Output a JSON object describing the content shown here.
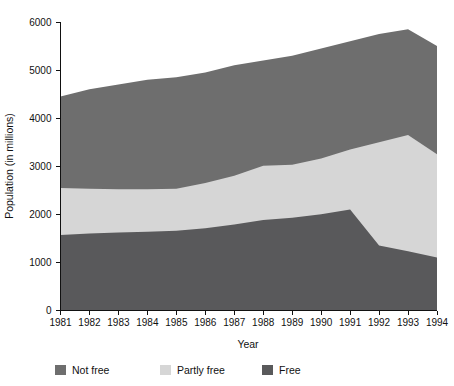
{
  "chart_data": {
    "type": "area",
    "stacked": true,
    "title": "",
    "xlabel": "Year",
    "ylabel": "Population (in millions)",
    "x": [
      1981,
      1982,
      1983,
      1984,
      1985,
      1986,
      1987,
      1988,
      1989,
      1990,
      1991,
      1992,
      1993,
      1994
    ],
    "categories": [
      "1981",
      "1982",
      "1983",
      "1984",
      "1985",
      "1986",
      "1987",
      "1988",
      "1989",
      "1990",
      "1991",
      "1992",
      "1993",
      "1994"
    ],
    "xlim": [
      1981,
      1994
    ],
    "ylim": [
      0,
      6000
    ],
    "yticks": [
      0,
      1000,
      2000,
      3000,
      4000,
      5000,
      6000
    ],
    "ytick_labels": [
      "0",
      "1000",
      "2000",
      "3000",
      "4000",
      "5000",
      "6000"
    ],
    "grid": false,
    "legend_position": "bottom-left",
    "stack_order_bottom_to_top": [
      "Free",
      "Partly free",
      "Not free"
    ],
    "series": [
      {
        "name": "Free",
        "color": "#59595b",
        "values": [
          1570,
          1600,
          1620,
          1640,
          1660,
          1710,
          1790,
          1880,
          1930,
          2000,
          2100,
          1350,
          1230,
          1100
        ],
        "cumulative_top": [
          1570,
          1600,
          1620,
          1640,
          1660,
          1710,
          1790,
          1880,
          1930,
          2000,
          2100,
          1350,
          1230,
          1100
        ]
      },
      {
        "name": "Partly free",
        "color": "#d6d6d6",
        "values": [
          980,
          930,
          900,
          880,
          870,
          940,
          1010,
          1130,
          1100,
          1160,
          1250,
          2150,
          2420,
          2150
        ],
        "cumulative_top": [
          2550,
          2530,
          2520,
          2520,
          2530,
          2650,
          2800,
          3010,
          3030,
          3160,
          3350,
          3500,
          3650,
          3250
        ]
      },
      {
        "name": "Not free",
        "color": "#6e6e6e",
        "values": [
          1900,
          2070,
          2180,
          2280,
          2320,
          2300,
          2300,
          2190,
          2270,
          2290,
          2250,
          2250,
          2200,
          2250
        ],
        "cumulative_top": [
          4450,
          4600,
          4700,
          4800,
          4850,
          4950,
          5100,
          5200,
          5300,
          5450,
          5600,
          5750,
          5850,
          5500
        ]
      }
    ],
    "totals": [
      4450,
      4600,
      4700,
      4800,
      4850,
      4950,
      5100,
      5200,
      5300,
      5450,
      5600,
      5750,
      5850,
      5500
    ]
  },
  "legend": {
    "items": [
      {
        "label": "Not free",
        "color": "#6e6e6e"
      },
      {
        "label": "Partly free",
        "color": "#d6d6d6"
      },
      {
        "label": "Free",
        "color": "#59595b"
      }
    ]
  },
  "axes": {
    "y_title": "Population (in millions)",
    "x_title": "Year"
  }
}
